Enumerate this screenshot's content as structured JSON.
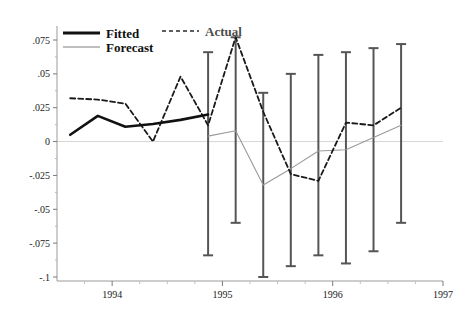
{
  "chart_data": {
    "type": "line",
    "title": "",
    "xlabel": "",
    "ylabel": "",
    "xlim": [
      1993.5,
      1997.0
    ],
    "ylim": [
      -0.1,
      0.0875
    ],
    "grid": false,
    "zero_line": true,
    "legend_position": "top-left",
    "yticks": [
      0.075,
      0.05,
      0.025,
      0,
      -0.025,
      -0.05,
      -0.075,
      -0.1
    ],
    "ytick_labels": [
      ".075",
      ".05",
      ".025",
      "0",
      "-.025",
      "-.05",
      "-.075",
      "-.1"
    ],
    "xticks": [
      1994,
      1995,
      1996,
      1997
    ],
    "xtick_labels": [
      "1994",
      "1995",
      "1996",
      "1997"
    ],
    "series": [
      {
        "name": "Fitted",
        "style": "solid-thick-black",
        "color": "#111111",
        "x": [
          1993.62,
          1993.87,
          1994.12,
          1994.37,
          1994.62,
          1994.87
        ],
        "values": [
          0.005,
          0.019,
          0.011,
          0.013,
          0.016,
          0.02
        ]
      },
      {
        "name": "Actual",
        "style": "dashed-black",
        "color": "#1a1a1a",
        "x": [
          1993.62,
          1993.87,
          1994.12,
          1994.37,
          1994.62,
          1994.87,
          1995.12,
          1995.37,
          1995.62,
          1995.87,
          1996.12,
          1996.37,
          1996.62
        ],
        "values": [
          0.032,
          0.031,
          0.028,
          0.0,
          0.048,
          0.012,
          0.077,
          0.022,
          -0.024,
          -0.029,
          0.014,
          0.012,
          0.025
        ]
      },
      {
        "name": "Forecast",
        "style": "solid-thin-gray",
        "color": "#9a9a9a",
        "x": [
          1994.87,
          1995.12,
          1995.37,
          1995.62,
          1995.87,
          1996.12,
          1996.37,
          1996.62
        ],
        "values": [
          0.004,
          0.008,
          -0.032,
          -0.02,
          -0.007,
          -0.006,
          0.003,
          0.012
        ]
      }
    ],
    "error_bars": {
      "name": "Forecast confidence interval",
      "color": "#555555",
      "x": [
        1994.87,
        1995.12,
        1995.37,
        1995.62,
        1995.87,
        1996.12,
        1996.37,
        1996.62
      ],
      "upper": [
        0.066,
        0.077,
        0.036,
        0.05,
        0.064,
        0.066,
        0.069,
        0.072
      ],
      "lower": [
        -0.084,
        -0.06,
        -0.1,
        -0.092,
        -0.084,
        -0.09,
        -0.081,
        -0.06
      ]
    }
  },
  "legend": {
    "items": [
      {
        "label": "Fitted",
        "marker": "solid-thick-line"
      },
      {
        "label": "Actual",
        "marker": "dashed-line"
      },
      {
        "label": "Forecast",
        "marker": "solid-thin-gray-line"
      }
    ]
  }
}
